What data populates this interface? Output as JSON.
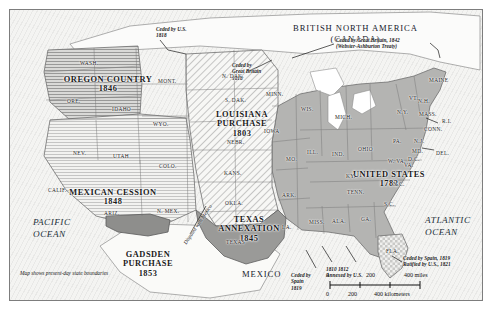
{
  "map": {
    "title_note": "Map shows present-day state boundaries",
    "countries": [
      {
        "name": "british-north-america",
        "line1": "BRITISH NORTH AMERICA",
        "line2": "(CANADA)",
        "x": 283,
        "y": 13
      },
      {
        "name": "mexico",
        "line1": "MEXICO",
        "line2": "",
        "x": 232,
        "y": 259
      }
    ],
    "oceans": [
      {
        "name": "pacific-ocean",
        "line1": "PACIFIC",
        "line2": "OCEAN",
        "x": 23,
        "y": 207
      },
      {
        "name": "atlantic-ocean",
        "line1": "ATLANTIC",
        "line2": "OCEAN",
        "x": 415,
        "y": 205
      }
    ],
    "territories": [
      {
        "name": "oregon-country",
        "lines": [
          "OREGON COUNTRY",
          "1846"
        ],
        "x": 46,
        "y": 65,
        "w": 104
      },
      {
        "name": "louisiana-purchase",
        "lines": [
          "LOUISIANA",
          "PURCHASE",
          "1803"
        ],
        "x": 192,
        "y": 100,
        "w": 80
      },
      {
        "name": "mexican-cession",
        "lines": [
          "MEXICAN CESSION",
          "1848"
        ],
        "x": 49,
        "y": 178,
        "w": 108
      },
      {
        "name": "gadsden-purchase",
        "lines": [
          "GADSDEN",
          "PURCHASE",
          "1853"
        ],
        "x": 102,
        "y": 240,
        "w": 72
      },
      {
        "name": "texas-annexation",
        "lines": [
          "TEXAS",
          "ANNEXATION",
          "1845"
        ],
        "x": 198,
        "y": 205,
        "w": 82
      },
      {
        "name": "united-states-1783",
        "lines": [
          "UNITED STATES",
          "1783"
        ],
        "x": 339,
        "y": 160,
        "w": 80
      }
    ],
    "annotations": [
      {
        "name": "ceded-by-us-1818",
        "lines": [
          "Ceded by U.S.",
          "1818"
        ],
        "x": 146,
        "y": 16
      },
      {
        "name": "ceded-by-great-britain-1818",
        "lines": [
          "Ceded by",
          "Great Britain",
          "1818"
        ],
        "x": 222,
        "y": 52
      },
      {
        "name": "webster-ashburton",
        "lines": [
          "Ceded by Great Britain, 1842",
          "(Webster-Ashburton Treaty)"
        ],
        "x": 326,
        "y": 27
      },
      {
        "name": "ceded-by-spain-1819-gulf",
        "lines": [
          "Ceded by",
          "Spain",
          "1819"
        ],
        "x": 281,
        "y": 262
      },
      {
        "name": "annexed-by-us",
        "lines": [
          "1810      1812",
          "Annexed by U.S."
        ],
        "x": 316,
        "y": 256
      },
      {
        "name": "ceded-by-spain-florida",
        "lines": [
          "Ceded by Spain, 1819",
          "Ratified by U.S., 1821"
        ],
        "x": 393,
        "y": 245
      },
      {
        "name": "disputed-with-mexico",
        "lines": [
          "Disputed with Mexico"
        ],
        "x": 172,
        "y": 232,
        "rotate": -56
      }
    ],
    "states": [
      {
        "abbr": "WASH.",
        "x": 70,
        "y": 50
      },
      {
        "abbr": "ORE.",
        "x": 57,
        "y": 88
      },
      {
        "abbr": "IDAHO",
        "x": 102,
        "y": 96
      },
      {
        "abbr": "MONT.",
        "x": 148,
        "y": 68
      },
      {
        "abbr": "WYO.",
        "x": 143,
        "y": 111
      },
      {
        "abbr": "NEV.",
        "x": 63,
        "y": 140
      },
      {
        "abbr": "UTAH",
        "x": 103,
        "y": 143
      },
      {
        "abbr": "CALIF.",
        "x": 38,
        "y": 177
      },
      {
        "abbr": "COLO.",
        "x": 149,
        "y": 153
      },
      {
        "abbr": "ARIZ.",
        "x": 94,
        "y": 200
      },
      {
        "abbr": "N. MEX.",
        "x": 147,
        "y": 198
      },
      {
        "abbr": "N. DAK.",
        "x": 212,
        "y": 63
      },
      {
        "abbr": "S. DAK.",
        "x": 215,
        "y": 87
      },
      {
        "abbr": "NEBR.",
        "x": 217,
        "y": 129
      },
      {
        "abbr": "KANS.",
        "x": 214,
        "y": 160
      },
      {
        "abbr": "OKLA.",
        "x": 215,
        "y": 190
      },
      {
        "abbr": "TEXAS",
        "x": 216,
        "y": 229
      },
      {
        "abbr": "MINN.",
        "x": 256,
        "y": 81
      },
      {
        "abbr": "IOWA",
        "x": 254,
        "y": 118
      },
      {
        "abbr": "MO.",
        "x": 276,
        "y": 146
      },
      {
        "abbr": "ARK.",
        "x": 272,
        "y": 182
      },
      {
        "abbr": "LA.",
        "x": 272,
        "y": 214
      },
      {
        "abbr": "WIS.",
        "x": 291,
        "y": 96
      },
      {
        "abbr": "ILL.",
        "x": 297,
        "y": 139
      },
      {
        "abbr": "IND.",
        "x": 322,
        "y": 141
      },
      {
        "abbr": "MICH.",
        "x": 325,
        "y": 104
      },
      {
        "abbr": "OHIO",
        "x": 348,
        "y": 136
      },
      {
        "abbr": "KY.",
        "x": 336,
        "y": 163
      },
      {
        "abbr": "TENN.",
        "x": 337,
        "y": 179
      },
      {
        "abbr": "MISS.",
        "x": 299,
        "y": 209
      },
      {
        "abbr": "ALA.",
        "x": 322,
        "y": 208
      },
      {
        "abbr": "GA.",
        "x": 351,
        "y": 206
      },
      {
        "abbr": "FLA.",
        "x": 376,
        "y": 238
      },
      {
        "abbr": "S.C.",
        "x": 374,
        "y": 191
      },
      {
        "abbr": "N.C.",
        "x": 383,
        "y": 171
      },
      {
        "abbr": "VA.",
        "x": 394,
        "y": 152
      },
      {
        "abbr": "W. VA.",
        "x": 378,
        "y": 148
      },
      {
        "abbr": "PA.",
        "x": 383,
        "y": 128
      },
      {
        "abbr": "N.Y.",
        "x": 387,
        "y": 99
      },
      {
        "abbr": "MD.",
        "x": 402,
        "y": 138
      },
      {
        "abbr": "D.C.",
        "x": 398,
        "y": 146
      },
      {
        "abbr": "N.J.",
        "x": 404,
        "y": 128
      },
      {
        "abbr": "DEL.",
        "x": 426,
        "y": 140
      },
      {
        "abbr": "CONN.",
        "x": 414,
        "y": 116
      },
      {
        "abbr": "R.I.",
        "x": 432,
        "y": 108
      },
      {
        "abbr": "MASS.",
        "x": 409,
        "y": 101
      },
      {
        "abbr": "N.H.",
        "x": 408,
        "y": 88
      },
      {
        "abbr": "VT.",
        "x": 399,
        "y": 85
      },
      {
        "abbr": "MAINE",
        "x": 419,
        "y": 67
      }
    ],
    "scale": {
      "miles_ticks": [
        "0",
        "200",
        "400 miles"
      ],
      "km_ticks": [
        "0",
        "200",
        "400 kilometers"
      ]
    }
  }
}
